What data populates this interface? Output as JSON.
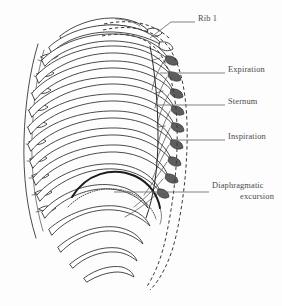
{
  "figure": {
    "background_color": "#fdfdfd",
    "line_color": "#2b2b2b",
    "label_color": "#4a4a4a",
    "leader_color": "#6a6a6a",
    "dashed_color": "#3a3a3a"
  },
  "labels": [
    {
      "id": "rib-1",
      "text": "Rib 1",
      "x": 198,
      "y": 18,
      "leader": "M 195 22 L 171 22 L 150 38",
      "lines": [
        "Rib 1"
      ]
    },
    {
      "id": "expiration",
      "text": "Expiration",
      "x": 228,
      "y": 69,
      "leader": "M 225 73 L 160 73",
      "lines": [
        "Expiration"
      ]
    },
    {
      "id": "sternum",
      "text": "Sternum",
      "x": 228,
      "y": 101,
      "leader": "M 225 105 L 158 105",
      "lines": [
        "Sternum"
      ]
    },
    {
      "id": "inspiration",
      "text": "Inspiration",
      "x": 228,
      "y": 136,
      "leader": "M 225 140 L 172 140",
      "lines": [
        "Inspiration"
      ]
    },
    {
      "id": "diaphragmatic-excursion",
      "text": "Diaphragmatic excursion",
      "x": 212,
      "y": 185,
      "leader": "M 209 192 L 114 192",
      "lines": [
        "Diaphragmatic",
        "excursion"
      ]
    }
  ],
  "anatomy": {
    "structures": [
      "rib-1",
      "ribs-2-12",
      "sternum",
      "costal-cartilages",
      "vertebral-column",
      "diaphragm-dome",
      "diaphragm-excursion-dotted",
      "expiration-outline-dashed",
      "inspiration-outline-dashed"
    ],
    "rib_count": 12,
    "view": "left oblique lateral"
  }
}
